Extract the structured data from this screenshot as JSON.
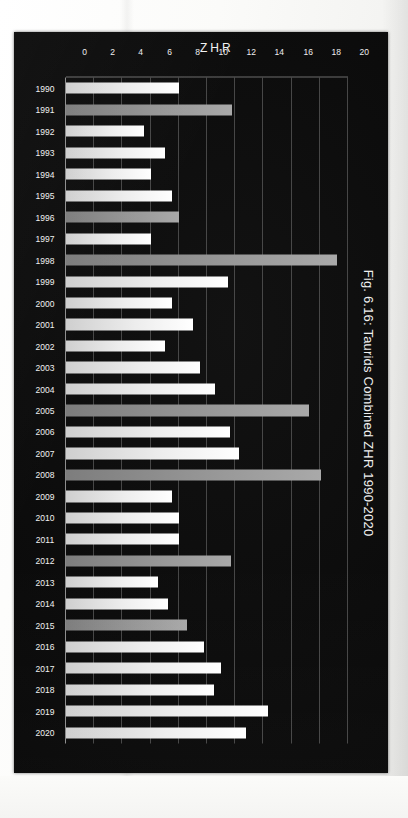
{
  "page": {
    "background_color": "#fbfbf9",
    "plate_color": "#0b0b0b"
  },
  "figure": {
    "title": "Fig. 6.16: Taurids Combined ZHR 1990-2020",
    "value_axis_title": "ZHR",
    "bar_color": "#ededed",
    "bar_color_alt": "#969696"
  },
  "chart_data": {
    "type": "bar",
    "orientation": "horizontal",
    "title": "Fig. 6.16: Taurids Combined ZHR 1990-2020",
    "xlabel": "",
    "ylabel": "ZHR",
    "grid": true,
    "legend": "none",
    "value_axis_ticks": [
      "0",
      "2",
      "4",
      "6",
      "8",
      "10",
      "12",
      "14",
      "16",
      "18",
      "20"
    ],
    "ylim": [
      0,
      20
    ],
    "categories": [
      "1990",
      "1991",
      "1992",
      "1993",
      "1994",
      "1995",
      "1996",
      "1997",
      "1998",
      "1999",
      "2000",
      "2001",
      "2002",
      "2003",
      "2004",
      "2005",
      "2006",
      "2007",
      "2008",
      "2009",
      "2010",
      "2011",
      "2012",
      "2013",
      "2014",
      "2015",
      "2016",
      "2017",
      "2018",
      "2019",
      "2020"
    ],
    "values": [
      8.0,
      11.8,
      5.5,
      7.0,
      6.0,
      7.5,
      8.0,
      6.0,
      19.2,
      11.5,
      7.5,
      9.0,
      7.0,
      9.5,
      10.6,
      17.2,
      11.6,
      12.3,
      18.1,
      7.5,
      8.0,
      8.0,
      11.7,
      6.5,
      7.2,
      8.6,
      9.8,
      11.0,
      10.5,
      14.3,
      12.8
    ],
    "highlighted_categories": [
      "1991",
      "1996",
      "1998",
      "2005",
      "2008",
      "2012",
      "2015"
    ]
  }
}
